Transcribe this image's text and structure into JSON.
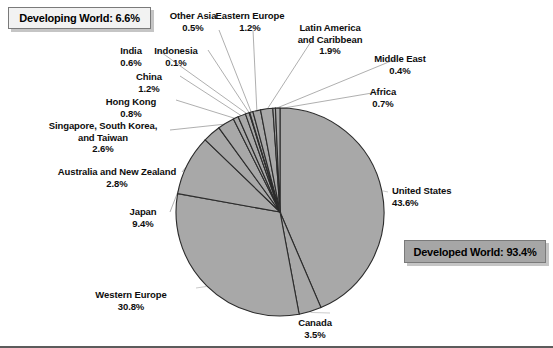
{
  "chart_data": {
    "type": "pie",
    "title": "",
    "start_angle_deg": 0,
    "direction": "clockwise",
    "center": {
      "x": 280,
      "y": 212
    },
    "radius": 104,
    "slice_fill": "#a8a8a8",
    "slice_stroke": "#2b2b2b",
    "categories": [
      "United States",
      "Canada",
      "Western Europe",
      "Japan",
      "Australia and New Zealand",
      "Singapore, South Korea, and Taiwan",
      "Hong Kong",
      "China",
      "India",
      "Indonesia",
      "Other Asia",
      "Eastern Europe",
      "Latin America and Caribbean",
      "Middle East",
      "Africa"
    ],
    "values": [
      43.6,
      3.5,
      30.8,
      9.4,
      2.8,
      2.6,
      0.8,
      1.2,
      0.6,
      0.1,
      0.5,
      1.2,
      1.9,
      0.4,
      0.7
    ],
    "unit": "%",
    "total": 100.0,
    "groups": [
      {
        "name": "Developed World",
        "value": 93.4
      },
      {
        "name": "Developing World",
        "value": 6.6
      }
    ]
  },
  "callouts": {
    "developing": "Developing World: 6.6%",
    "developed": "Developed World: 93.4%"
  },
  "labels": [
    {
      "name": "united-states",
      "text": "United States",
      "pct": "43.6%"
    },
    {
      "name": "canada",
      "text": "Canada",
      "pct": "3.5%"
    },
    {
      "name": "western-europe",
      "text": "Western Europe",
      "pct": "30.8%"
    },
    {
      "name": "japan",
      "text": "Japan",
      "pct": "9.4%"
    },
    {
      "name": "australia-nz",
      "text": "Australia and New Zealand",
      "pct": "2.8%"
    },
    {
      "name": "singapore-korea-taiwan",
      "line1": "Singapore, South Korea,",
      "line2": "and Taiwan",
      "pct": "2.6%"
    },
    {
      "name": "hong-kong",
      "text": "Hong Kong",
      "pct": "0.8%"
    },
    {
      "name": "china",
      "text": "China",
      "pct": "1.2%"
    },
    {
      "name": "india",
      "text": "India",
      "pct": "0.6%"
    },
    {
      "name": "indonesia",
      "text": "Indonesia",
      "pct": "0.1%"
    },
    {
      "name": "other-asia",
      "text": "Other Asia",
      "pct": "0.5%"
    },
    {
      "name": "eastern-europe",
      "text": "Eastern Europe",
      "pct": "1.2%"
    },
    {
      "name": "latin-america",
      "line1": "Latin America",
      "line2": "and Caribbean",
      "pct": "1.9%"
    },
    {
      "name": "middle-east",
      "text": "Middle East",
      "pct": "0.4%"
    },
    {
      "name": "africa",
      "text": "Africa",
      "pct": "0.7%"
    }
  ]
}
